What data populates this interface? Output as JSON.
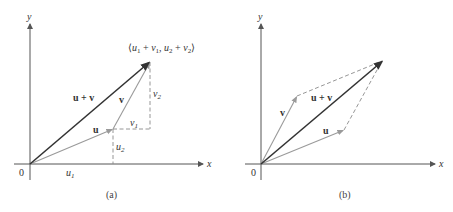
{
  "panels": [
    {
      "caption": "(a)",
      "axes": {
        "x_label": "x",
        "y_label": "y",
        "origin_label": "0"
      },
      "vectors": {
        "u": "u",
        "v": "v",
        "sum": "u + v"
      },
      "point_label": "⟨u₁ + v₁, u₂ + v₂⟩",
      "component_labels": {
        "u1": "u",
        "u1_sub": "1",
        "u2": "u",
        "u2_sub": "2",
        "v1": "v",
        "v1_sub": "1",
        "v2": "v",
        "v2_sub": "2"
      }
    },
    {
      "caption": "(b)",
      "axes": {
        "x_label": "x",
        "y_label": "y",
        "origin_label": "0"
      },
      "vectors": {
        "u": "u",
        "v": "v",
        "sum": "u + v"
      }
    }
  ],
  "colors": {
    "dark_vector": "#333333",
    "light_vector": "#9a9a9a",
    "axis": "#555555"
  }
}
